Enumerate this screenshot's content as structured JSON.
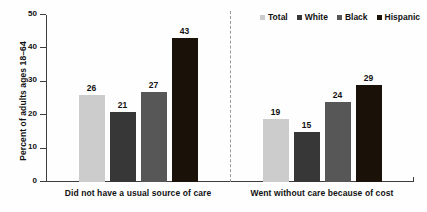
{
  "chart_data": {
    "type": "bar",
    "title": "",
    "subtitle": "",
    "xlabel": "",
    "ylabel": "Percent of adults ages 18–64",
    "ylim": [
      0,
      50
    ],
    "yticks": [
      0,
      10,
      20,
      30,
      40,
      50
    ],
    "ytick_labels": [
      "0",
      "10",
      "20",
      "30",
      "40",
      "50"
    ],
    "grid": false,
    "legend_position": "top-right",
    "group_separator": true,
    "categories": [
      "Did not have a usual source of care",
      "Went without care because of cost"
    ],
    "series": [
      {
        "name": "Total",
        "color": "#cccccc",
        "values": [
          26,
          19
        ],
        "labels": [
          "26",
          "19"
        ]
      },
      {
        "name": "White",
        "color": "#373737",
        "values": [
          21,
          15
        ],
        "labels": [
          "21",
          "15"
        ]
      },
      {
        "name": "Black",
        "color": "#575757",
        "values": [
          27,
          24
        ],
        "labels": [
          "27",
          "24"
        ]
      },
      {
        "name": "Hispanic",
        "color": "#1a1208",
        "values": [
          43,
          29
        ],
        "labels": [
          "43",
          "29"
        ]
      }
    ]
  },
  "legend": {
    "items": [
      {
        "label": "Total",
        "color": "#cccccc"
      },
      {
        "label": "White",
        "color": "#373737"
      },
      {
        "label": "Black",
        "color": "#575757"
      },
      {
        "label": "Hispanic",
        "color": "#1a1208"
      }
    ]
  },
  "axis": {
    "y_title": "Percent of adults ages 18–64"
  }
}
